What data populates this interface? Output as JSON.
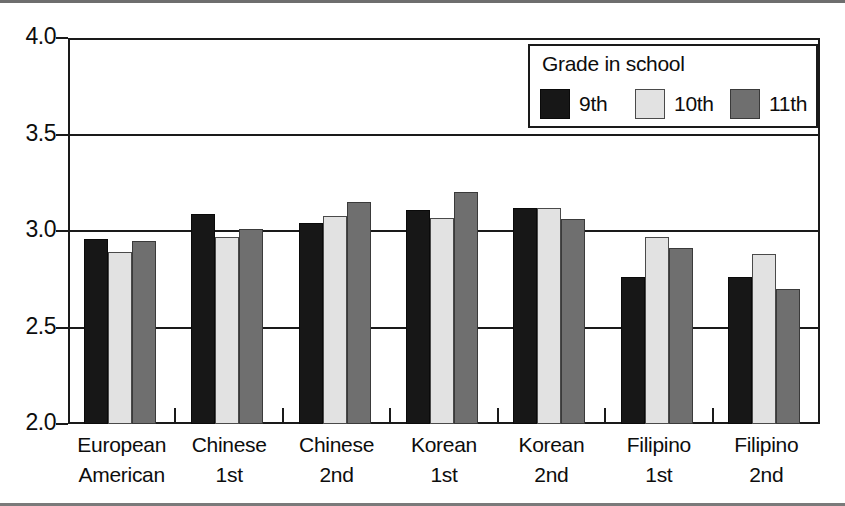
{
  "chart_data": {
    "type": "bar",
    "title": "",
    "subtitle": "",
    "xlabel": "",
    "ylabel": "",
    "ylim": [
      2.0,
      4.0
    ],
    "ytick_labels": [
      "4.0",
      "3.5",
      "3.0",
      "2.5",
      "2.0"
    ],
    "ytick_values": [
      4.0,
      3.5,
      3.0,
      2.5,
      2.0
    ],
    "grid": true,
    "grid_axis": "y",
    "legend_position": "top-right",
    "legend_title": "Grade in school",
    "categories": [
      "European American",
      "Chinese 1st",
      "Chinese 2nd",
      "Korean 1st",
      "Korean 2nd",
      "Filipino 1st",
      "Filipino 2nd"
    ],
    "category_lines": [
      [
        "European",
        "American"
      ],
      [
        "Chinese",
        "1st"
      ],
      [
        "Chinese",
        "2nd"
      ],
      [
        "Korean",
        "1st"
      ],
      [
        "Korean",
        "2nd"
      ],
      [
        "Filipino",
        "1st"
      ],
      [
        "Filipino",
        "2nd"
      ]
    ],
    "series": [
      {
        "name": "9th",
        "color": "#171717",
        "values": [
          2.96,
          3.09,
          3.04,
          3.11,
          3.12,
          2.76,
          2.76
        ]
      },
      {
        "name": "10th",
        "color": "#e2e2e2",
        "values": [
          2.89,
          2.97,
          3.08,
          3.07,
          3.12,
          2.97,
          2.88
        ]
      },
      {
        "name": "11th",
        "color": "#6f6f6f",
        "values": [
          2.95,
          3.01,
          3.15,
          3.2,
          3.06,
          2.91,
          2.7
        ]
      }
    ]
  },
  "legend": {
    "title": "Grade in school",
    "items": [
      {
        "label": "9th",
        "swatch": "swatch-9th"
      },
      {
        "label": "10th",
        "swatch": "swatch-10th"
      },
      {
        "label": "11th",
        "swatch": "swatch-11th"
      }
    ]
  },
  "axis": {
    "y_labels": [
      "4.0",
      "3.5",
      "3.0",
      "2.5",
      "2.0"
    ]
  }
}
